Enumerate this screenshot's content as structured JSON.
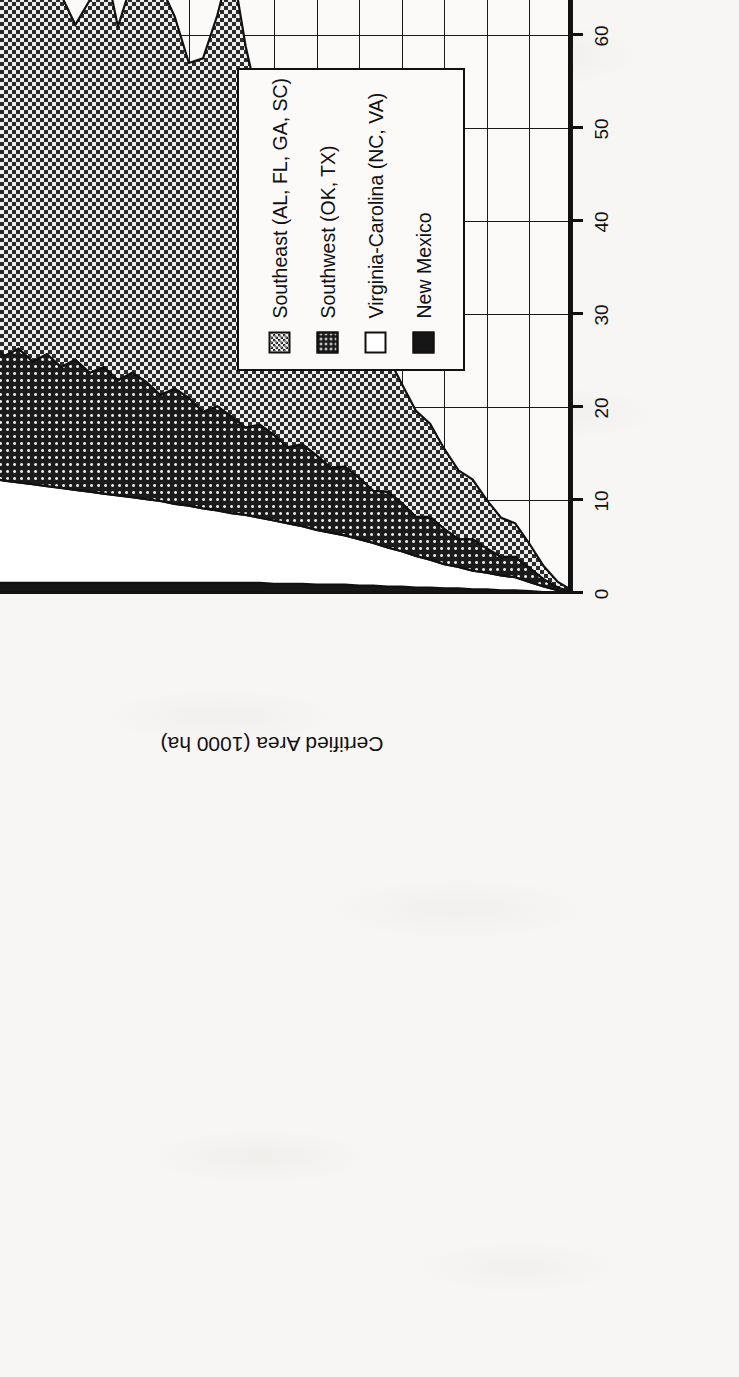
{
  "figure": {
    "orientation": "rotated-90-ccw",
    "paper": "#f7f6f4"
  },
  "legend": {
    "position": "top-left-rotated",
    "items": [
      {
        "label": "Southeast (AL, FL, GA, SC)",
        "swatch": "checkered-pattern",
        "color": "#555555"
      },
      {
        "label": "Southwest (OK, TX)",
        "swatch": "dotted-on-black-pattern",
        "color": "#1d1d1d"
      },
      {
        "label": "Virginia-Carolina (NC, VA)",
        "swatch": "white-fill",
        "color": "#ffffff"
      },
      {
        "label": "New Mexico",
        "swatch": "solid-black-fill",
        "color": "#161616"
      }
    ]
  },
  "chart_data": {
    "type": "area",
    "stacked": true,
    "title": "",
    "xlabel": "",
    "ylabel": "Certified Area (1000 ha)",
    "xlim": [
      1946,
      1988
    ],
    "ylim": [
      0,
      80
    ],
    "ytick_labels": [
      "0",
      "10",
      "20",
      "30",
      "40",
      "50",
      "60",
      "70",
      "80"
    ],
    "yticks": [
      0,
      10,
      20,
      30,
      40,
      50,
      60,
      70,
      80
    ],
    "xtick_labels": [
      "1946",
      "1949",
      "1952",
      "1955",
      "1958",
      "1961",
      "1964",
      "1967",
      "1970",
      "1973",
      "1976",
      "1979",
      "1982",
      "1985",
      "1988"
    ],
    "xticks": [
      1946,
      1949,
      1952,
      1955,
      1958,
      1961,
      1964,
      1967,
      1970,
      1973,
      1976,
      1979,
      1982,
      1985,
      1988
    ],
    "grid": true,
    "legend_position": "outside-top-left",
    "x": [
      1946,
      1947,
      1948,
      1949,
      1950,
      1951,
      1952,
      1953,
      1954,
      1955,
      1956,
      1957,
      1958,
      1959,
      1960,
      1961,
      1962,
      1963,
      1964,
      1965,
      1966,
      1967,
      1968,
      1969,
      1970,
      1971,
      1972,
      1973,
      1974,
      1975,
      1976,
      1977,
      1978,
      1979,
      1980,
      1981,
      1982,
      1983,
      1984,
      1985,
      1986,
      1987,
      1988
    ],
    "series": [
      {
        "name": "New Mexico",
        "fill": "solid-black",
        "values": [
          0.0,
          0.1,
          0.2,
          0.3,
          0.4,
          0.4,
          0.5,
          0.5,
          0.6,
          0.6,
          0.7,
          0.7,
          0.8,
          0.8,
          0.9,
          0.9,
          1.0,
          1.0,
          1.0,
          1.1,
          1.1,
          1.1,
          1.2,
          1.2,
          1.2,
          1.2,
          1.2,
          1.2,
          1.2,
          1.2,
          1.2,
          1.2,
          1.2,
          1.2,
          1.2,
          1.2,
          1.2,
          1.2,
          1.2,
          1.2,
          1.2,
          1.2,
          1.2
        ]
      },
      {
        "name": "Virginia-Carolina (NC, VA)",
        "fill": "white",
        "values": [
          0.1,
          0.3,
          0.6,
          1.0,
          1.4,
          1.6,
          1.8,
          2.0,
          2.3,
          2.6,
          3.0,
          3.4,
          3.8,
          4.2,
          4.6,
          5.0,
          5.3,
          5.6,
          5.9,
          6.2,
          6.5,
          6.8,
          7.0,
          7.3,
          7.5,
          7.8,
          8.0,
          8.3,
          8.5,
          8.8,
          9.0,
          9.2,
          9.4,
          9.6,
          9.8,
          10.0,
          10.2,
          10.4,
          10.6,
          10.8,
          11.0,
          11.2,
          11.4
        ]
      },
      {
        "name": "Southwest (OK, TX)",
        "fill": "dotted-on-black",
        "values": [
          0.1,
          0.3,
          0.8,
          1.5,
          2.2,
          2.0,
          2.6,
          3.4,
          3.0,
          3.8,
          4.6,
          4.2,
          5.2,
          6.0,
          5.6,
          6.6,
          7.4,
          7.0,
          8.0,
          8.8,
          8.2,
          9.2,
          10.0,
          9.4,
          10.4,
          11.2,
          10.4,
          11.6,
          12.4,
          11.4,
          12.6,
          13.4,
          12.4,
          13.6,
          12.8,
          14.0,
          13.0,
          14.2,
          13.2,
          14.4,
          13.4,
          14.6,
          13.0
        ]
      },
      {
        "name": "Southeast (AL, FL, GA, SC)",
        "fill": "checkered",
        "values": [
          0.2,
          0.6,
          1.4,
          2.6,
          3.6,
          4.2,
          5.2,
          6.4,
          7.4,
          8.6,
          10.0,
          11.4,
          12.8,
          14.6,
          16.4,
          18.2,
          20.0,
          21.8,
          23.6,
          25.4,
          27.4,
          30.0,
          34.0,
          41.0,
          49.0,
          42.0,
          38.0,
          36.0,
          40.0,
          44.0,
          48.0,
          42.0,
          38.0,
          44.0,
          40.0,
          36.0,
          40.0,
          44.0,
          48.0,
          57.0,
          44.0,
          42.0,
          43.0
        ]
      }
    ],
    "totals": [
      0.4,
      1.3,
      3.0,
      5.4,
      7.6,
      8.2,
      10.1,
      12.3,
      13.3,
      15.6,
      18.3,
      19.7,
      22.6,
      25.6,
      27.5,
      30.7,
      33.7,
      35.4,
      38.5,
      41.5,
      43.2,
      47.1,
      52.2,
      58.9,
      68.1,
      62.2,
      57.6,
      57.1,
      62.1,
      65.4,
      70.8,
      65.8,
      61.0,
      68.4,
      63.8,
      61.2,
      64.4,
      69.8,
      73.0,
      83.4,
      69.6,
      69.0,
      68.6
    ]
  }
}
